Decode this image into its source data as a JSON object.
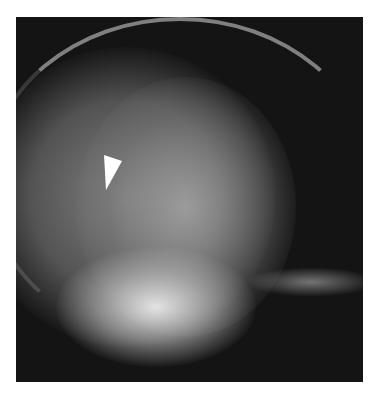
{
  "image": {
    "type": "radiograph",
    "description": "Lateral skull X-ray with a white arrowhead marker",
    "annotations": [
      {
        "kind": "arrowhead",
        "color": "#ffffff",
        "x": 104,
        "y": 156,
        "pointing": "down-left"
      }
    ],
    "colors": {
      "background": "#ffffff",
      "film": "#141414",
      "bone": "#e8e8e8"
    }
  }
}
